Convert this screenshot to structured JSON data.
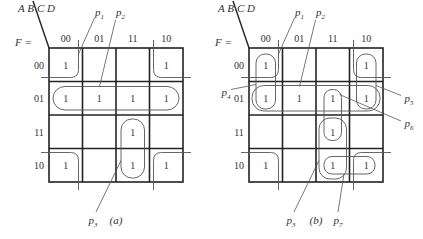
{
  "figures": [
    {
      "id": "a",
      "caption": "(a)",
      "function_label": "F =",
      "row_var": "A B",
      "col_var": "C D",
      "col_headers": [
        "00",
        "01",
        "11",
        "10"
      ],
      "row_headers": [
        "00",
        "01",
        "11",
        "10"
      ],
      "cells": [
        [
          "1",
          "",
          "",
          "1"
        ],
        [
          "1",
          "1",
          "1",
          "1"
        ],
        [
          "",
          "",
          "1",
          ""
        ],
        [
          "1",
          "",
          "1",
          "1"
        ]
      ],
      "prime_implicants": [
        {
          "sub": "1",
          "label": "p",
          "desc": "four corners (B'D')"
        },
        {
          "sub": "2",
          "label": "p",
          "desc": "row 01 (A'B)"
        },
        {
          "sub": "3",
          "label": "p",
          "desc": "column 11 rows 11,10 (ACD)"
        }
      ]
    },
    {
      "id": "b",
      "caption": "(b)",
      "function_label": "F =",
      "row_var": "A B",
      "col_var": "C D",
      "col_headers": [
        "00",
        "01",
        "11",
        "10"
      ],
      "row_headers": [
        "00",
        "01",
        "11",
        "10"
      ],
      "cells": [
        [
          "1",
          "",
          "",
          "1"
        ],
        [
          "1",
          "1",
          "1",
          "1"
        ],
        [
          "",
          "",
          "1",
          ""
        ],
        [
          "1",
          "",
          "1",
          "1"
        ]
      ],
      "prime_implicants": [
        {
          "sub": "1",
          "label": "p"
        },
        {
          "sub": "2",
          "label": "p"
        },
        {
          "sub": "3",
          "label": "p"
        },
        {
          "sub": "4",
          "label": "p"
        },
        {
          "sub": "5",
          "label": "p"
        },
        {
          "sub": "6",
          "label": "p"
        },
        {
          "sub": "7",
          "label": "p"
        }
      ]
    }
  ]
}
